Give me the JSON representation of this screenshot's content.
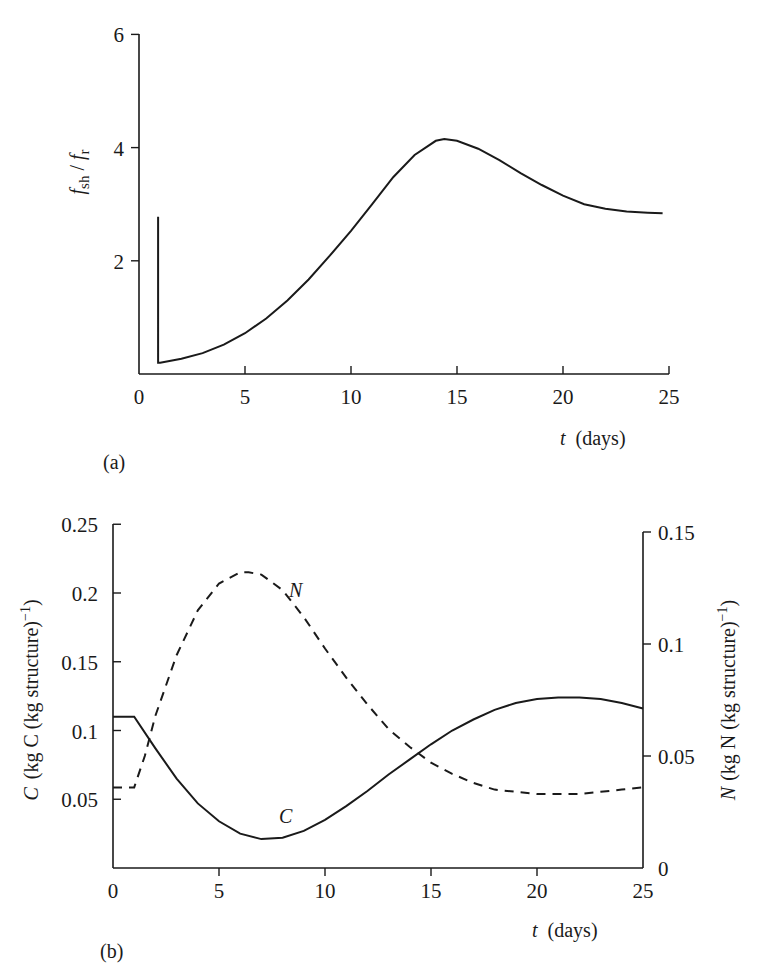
{
  "chart_data": [
    {
      "panel": "(a)",
      "type": "line",
      "title": "",
      "xlabel": "t (days)",
      "ylabel": "f_sh / f_r",
      "xlim": [
        0,
        25
      ],
      "ylim": [
        0,
        6
      ],
      "xticks": [
        0,
        5,
        10,
        15,
        20,
        25
      ],
      "yticks": [
        2,
        4,
        6
      ],
      "grid": false,
      "series": [
        {
          "name": "f_sh/f_r",
          "style": "solid",
          "x": [
            0.9,
            0.9,
            1.0,
            2,
            3,
            4,
            5,
            6,
            7,
            8,
            9,
            10,
            11,
            12,
            13,
            14,
            14.4,
            15,
            16,
            17,
            18,
            19,
            20,
            21,
            22,
            23,
            24,
            24.7
          ],
          "y": [
            2.78,
            0.2,
            0.2,
            0.27,
            0.37,
            0.52,
            0.72,
            0.98,
            1.3,
            1.67,
            2.09,
            2.53,
            3.0,
            3.48,
            3.87,
            4.12,
            4.15,
            4.12,
            3.98,
            3.78,
            3.55,
            3.34,
            3.15,
            3.0,
            2.92,
            2.87,
            2.85,
            2.84
          ]
        }
      ]
    },
    {
      "panel": "(b)",
      "type": "line",
      "title": "",
      "xlabel": "t (days)",
      "ylabel_left": "C (kg C (kg structure)^-1)",
      "ylabel_right": "N (kg N (kg structure)^-1)",
      "xlim": [
        0,
        25
      ],
      "ylim_left": [
        0,
        0.25
      ],
      "ylim_right": [
        0,
        0.15
      ],
      "xticks": [
        0,
        5,
        10,
        15,
        20,
        25
      ],
      "yticks_left": [
        0.05,
        0.1,
        0.15,
        0.2,
        0.25
      ],
      "yticks_right": [
        0,
        0.05,
        0.1,
        0.15
      ],
      "grid": false,
      "annotations": [
        {
          "text": "N",
          "x": 8.2,
          "y_left": 0.2
        },
        {
          "text": "C",
          "x": 8.0,
          "y_left": 0.03
        }
      ],
      "series": [
        {
          "name": "C",
          "axis": "left",
          "style": "solid",
          "x": [
            0,
            1.0,
            2,
            3,
            4,
            5,
            6,
            7,
            8,
            9,
            10,
            11,
            12,
            13,
            14,
            15,
            16,
            17,
            18,
            19,
            20,
            21,
            22,
            23,
            24,
            25
          ],
          "y": [
            0.11,
            0.11,
            0.087,
            0.065,
            0.047,
            0.034,
            0.025,
            0.021,
            0.022,
            0.027,
            0.035,
            0.045,
            0.056,
            0.068,
            0.079,
            0.09,
            0.1,
            0.108,
            0.115,
            0.12,
            0.123,
            0.124,
            0.124,
            0.123,
            0.12,
            0.116
          ]
        },
        {
          "name": "N",
          "axis": "right",
          "style": "dashed",
          "x": [
            0,
            1.0,
            1.5,
            2,
            3,
            4,
            5,
            6,
            6.4,
            7,
            8,
            9,
            10,
            11,
            12,
            13,
            14,
            15,
            16,
            17,
            18,
            19,
            20,
            21,
            22,
            23,
            24,
            25
          ],
          "y": [
            0.036,
            0.036,
            0.05,
            0.068,
            0.095,
            0.115,
            0.127,
            0.132,
            0.132,
            0.131,
            0.124,
            0.112,
            0.098,
            0.085,
            0.073,
            0.062,
            0.054,
            0.047,
            0.042,
            0.038,
            0.035,
            0.034,
            0.033,
            0.033,
            0.033,
            0.034,
            0.035,
            0.036
          ]
        }
      ]
    }
  ],
  "panel_a": {
    "label": "(a)",
    "y_axis_title_f": "f",
    "y_axis_title_sub1": "sh",
    "y_axis_title_slash": " / ",
    "y_axis_title_f2": "f",
    "y_axis_title_sub2": "r",
    "x_axis_title_t": "t",
    "x_axis_title_unit": "(days)",
    "yticks": [
      "2",
      "4",
      "6"
    ],
    "xticks": [
      "0",
      "5",
      "10",
      "15",
      "20",
      "25"
    ]
  },
  "panel_b": {
    "label": "(b)",
    "y_left_title_var": "C",
    "y_left_title_unit": "(kg C (kg structure)",
    "y_left_title_exp": "−1",
    "y_left_title_close": ")",
    "y_right_title_var": "N",
    "y_right_title_unit": "(kg N (kg structure)",
    "y_right_title_exp": "−1",
    "y_right_title_close": ")",
    "x_axis_title_t": "t",
    "x_axis_title_unit": "(days)",
    "yticks_left": [
      "0.05",
      "0.1",
      "0.15",
      "0.2",
      "0.25"
    ],
    "yticks_right": [
      "0",
      "0.05",
      "0.1",
      "0.15"
    ],
    "xticks": [
      "0",
      "5",
      "10",
      "15",
      "20",
      "25"
    ],
    "label_N": "N",
    "label_C": "C"
  }
}
